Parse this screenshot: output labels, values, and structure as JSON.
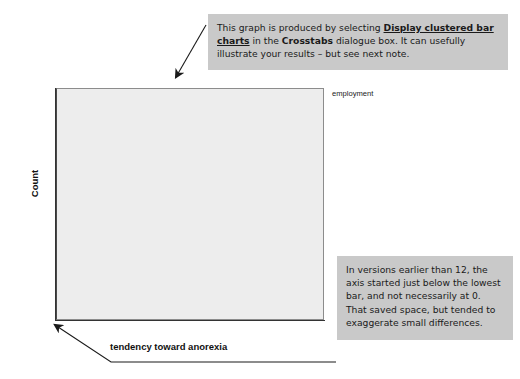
{
  "notes": {
    "top": {
      "segments": [
        {
          "text": "This graph is produced by selecting ",
          "style": "normal"
        },
        {
          "text": "Display clustered bar charts",
          "style": "bold-underline"
        },
        {
          "text": " in the ",
          "style": "normal"
        },
        {
          "text": "Crosstabs",
          "style": "bold"
        },
        {
          "text": " dialogue box. It can usefully illustrate your results – but see next note.",
          "style": "normal"
        }
      ],
      "plain": "This graph is produced by selecting Display clustered bar charts in the Crosstabs dialogue box. It can usefully illustrate your results – but see next note."
    },
    "bottom": {
      "text": "In versions earlier than 12, the axis started just below the lowest bar, and not necessarily at 0. That saved space, but tended to exaggerate small differences."
    }
  },
  "chart_data": {
    "type": "bar",
    "title": "",
    "subtitle": "",
    "xlabel": "tendency toward anorexia",
    "ylabel": "Count",
    "categories": [
      "high",
      "low"
    ],
    "series": [
      {
        "name": "f/t",
        "values": [
          14,
          17
        ],
        "color": "#6e6e6e"
      },
      {
        "name": "none",
        "values": [
          13,
          12
        ],
        "color": "#a8a8a8"
      },
      {
        "name": "p/t",
        "values": [
          11,
          13
        ],
        "color": "#cdcdcd"
      }
    ],
    "legend_title": "employment",
    "legend_position": "right",
    "ylim": [
      0,
      20
    ],
    "yticks": [
      0,
      5,
      10,
      15,
      20
    ],
    "ytick_labels": [
      "0",
      "5",
      "10",
      "15",
      "20"
    ],
    "grid": false,
    "plot_background": "#ededed"
  },
  "colors": {
    "note_background": "#c9c9c9",
    "plot_background": "#ededed",
    "axis": "#333333",
    "bar_ft": "#6e6e6e",
    "bar_none": "#a8a8a8",
    "bar_pt": "#cdcdcd",
    "arrow": "#1a1a1a"
  },
  "arrows": {
    "top": {
      "name": "arrow-to-chart",
      "description": "diagonal arrow from top note pointing down-left toward chart"
    },
    "bottom": {
      "name": "arrow-to-origin",
      "description": "elbow arrow from bottom note pointing to axis origin at 0"
    }
  }
}
